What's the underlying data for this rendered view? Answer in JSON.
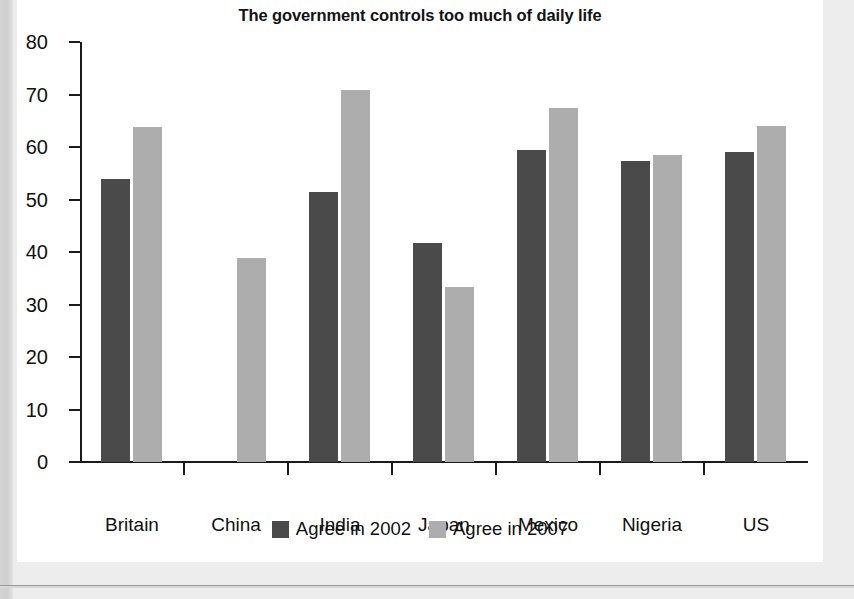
{
  "chart_data": {
    "type": "bar",
    "title": "The government controls too much of daily life",
    "xlabel": "",
    "ylabel": "",
    "ylim": [
      0,
      80
    ],
    "yticks": [
      0,
      10,
      20,
      30,
      40,
      50,
      60,
      70,
      80
    ],
    "grid": false,
    "legend_position": "bottom",
    "categories": [
      "Britain",
      "China",
      "India",
      "Japan",
      "Mexico",
      "Nigeria",
      "US"
    ],
    "series": [
      {
        "name": "Agree in 2002",
        "color": "#4a4a4a",
        "values": [
          54,
          null,
          51.5,
          41.8,
          59.4,
          57.3,
          59
        ]
      },
      {
        "name": "Agree in 2007",
        "color": "#adadad",
        "values": [
          63.8,
          38.8,
          70.8,
          33.4,
          67.4,
          58.4,
          64
        ]
      }
    ]
  },
  "panel": {
    "background": "#ffffff",
    "page_background": "#ededed"
  }
}
